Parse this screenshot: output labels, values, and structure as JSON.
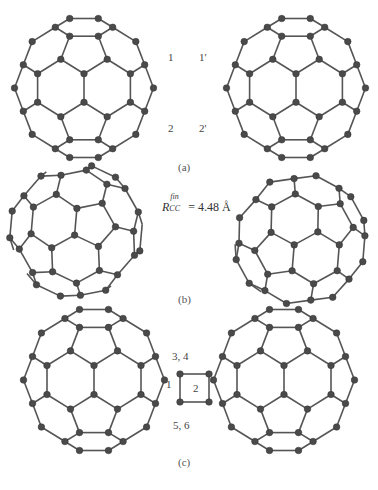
{
  "figure": {
    "panels": [
      {
        "id": "a",
        "caption": "(a)",
        "atom_labels_left": [
          "1",
          "2"
        ],
        "atom_labels_right": [
          "1'",
          "2'"
        ]
      },
      {
        "id": "b",
        "caption": "(b)",
        "distance_label": {
          "symbol": "R",
          "subscript": "CC",
          "superscript": "fin",
          "value": "= 4.48 Å"
        }
      },
      {
        "id": "c",
        "caption": "(c)",
        "atom_labels": [
          "3, 4",
          "5, 6"
        ],
        "ring_labels": [
          "1",
          "2"
        ]
      }
    ],
    "colors": {
      "bond": "#555555",
      "atom": "#4a4a4a",
      "atom_highlight": "#8a8a8a",
      "text": "#444444"
    }
  }
}
